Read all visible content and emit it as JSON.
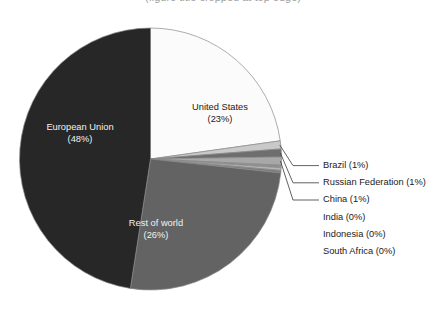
{
  "title": {
    "text": "(figure title cropped at top edge)"
  },
  "chart_data": {
    "type": "pie",
    "title": "",
    "subtitle": "",
    "xlabel": "",
    "ylabel": "",
    "legend_position": "right",
    "grid": false,
    "start_angle_deg": 0,
    "direction": "clockwise",
    "units": "percent",
    "categories": [
      "United States",
      "Brazil",
      "Russian Federation",
      "China",
      "India",
      "Indonesia",
      "South Africa",
      "Rest of world",
      "European Union"
    ],
    "values": [
      23,
      1,
      1,
      1,
      0,
      0,
      0,
      26,
      48
    ],
    "colors": [
      "#fbfbfb",
      "#c9c9c9",
      "#6e6e6e",
      "#a8a8a8",
      "#909090",
      "#b5b5b5",
      "#7d7d7d",
      "#636363",
      "#272727"
    ],
    "slices": [
      {
        "label": "United States",
        "percent_text": "(23%)",
        "value": 23,
        "color": "#fbfbfb",
        "label_placement": "inside",
        "label_color": "#1a1a1a"
      },
      {
        "label": "Brazil",
        "percent_text": "(1%)",
        "value": 1,
        "color": "#c9c9c9",
        "label_placement": "callout",
        "label_color": "#1a1a1a"
      },
      {
        "label": "Russian Federation",
        "percent_text": "(1%)",
        "value": 1,
        "color": "#6e6e6e",
        "label_placement": "callout",
        "label_color": "#1a1a1a"
      },
      {
        "label": "China",
        "percent_text": "(1%)",
        "value": 1,
        "color": "#a8a8a8",
        "label_placement": "callout",
        "label_color": "#1a1a1a"
      },
      {
        "label": "India",
        "percent_text": "(0%)",
        "value": 0,
        "color": "#909090",
        "label_placement": "list",
        "label_color": "#1a1a1a"
      },
      {
        "label": "Indonesia",
        "percent_text": "(0%)",
        "value": 0,
        "color": "#b5b5b5",
        "label_placement": "list",
        "label_color": "#1a1a1a"
      },
      {
        "label": "South Africa",
        "percent_text": "(0%)",
        "value": 0,
        "color": "#7d7d7d",
        "label_placement": "list",
        "label_color": "#1a1a1a"
      },
      {
        "label": "Rest of world",
        "percent_text": "(26%)",
        "value": 26,
        "color": "#636363",
        "label_placement": "inside",
        "label_color": "#f2f2f2"
      },
      {
        "label": "European Union",
        "percent_text": "(48%)",
        "value": 48,
        "color": "#272727",
        "label_placement": "inside",
        "label_color": "#f2f2f2"
      }
    ]
  },
  "pie_labels": {
    "european_union": {
      "name": "European Union",
      "pct": "(48%)"
    },
    "united_states": {
      "name": "United States",
      "pct": "(23%)"
    },
    "rest_of_world": {
      "name": "Rest of world",
      "pct": "(26%)"
    }
  },
  "legend": {
    "items": [
      {
        "text": "Brazil (1%)",
        "has_leader_line": true
      },
      {
        "text": "Russian Federation (1%)",
        "has_leader_line": true
      },
      {
        "text": "China (1%)",
        "has_leader_line": true
      },
      {
        "text": "India (0%)",
        "has_leader_line": false
      },
      {
        "text": "Indonesia (0%)",
        "has_leader_line": false
      },
      {
        "text": "South Africa (0%)",
        "has_leader_line": false
      }
    ]
  },
  "style": {
    "background": "#ffffff",
    "text_color": "#1a1a1a",
    "outline_color": "#8a8a8a"
  }
}
